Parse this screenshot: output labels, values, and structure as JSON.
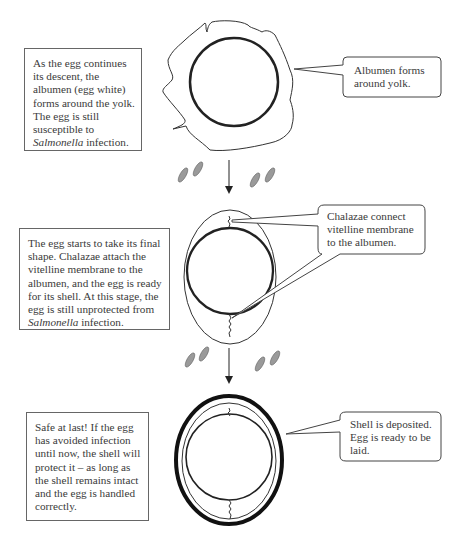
{
  "stages": [
    {
      "id": "albumen",
      "description": {
        "text_before": "As the egg continues its descent, the albumen (egg white) forms around the yolk. The egg is still susceptible to ",
        "italic": "Salmonella",
        "text_after": " infection."
      },
      "callout": "Albumen forms around yolk."
    },
    {
      "id": "chalazae",
      "description": {
        "text_before": "The egg starts to take its final shape. Chalazae attach the vitelline membrane to the albumen, and the egg is ready for its shell. At this stage, the egg is still unprotected from ",
        "italic": "Salmonella",
        "text_after": " infection."
      },
      "callout": "Chalazae connect vitelline membrane to the albumen."
    },
    {
      "id": "shell",
      "description": {
        "text_before": "Safe at last! If the egg has avoided infection until now, the shell will protect it – as long as the shell remains intact and the egg is handled correctly.",
        "italic": "",
        "text_after": ""
      },
      "callout": "Shell is deposited. Egg is ready to be laid."
    }
  ],
  "icons": {
    "bacteria": "salmonella-bacteria-icon",
    "arrow": "down-arrow-icon"
  },
  "colors": {
    "stroke": "#333333",
    "bacteria_fill": "#9a9a9a",
    "box_border": "#666666"
  }
}
